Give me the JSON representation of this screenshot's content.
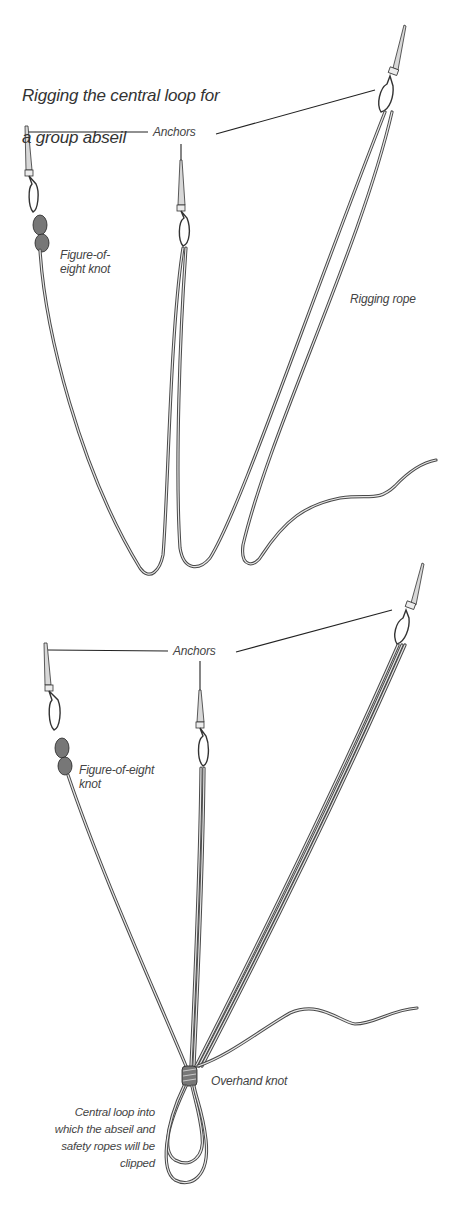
{
  "title": "Rigging the central loop for a group abseil",
  "title_lines": [
    "Rigging the central loop for",
    "a group abseil"
  ],
  "panel_top": {
    "labels": {
      "anchors": "Anchors",
      "figure_of_eight": "Figure-of-\neight knot",
      "rigging_rope": "Rigging rope"
    },
    "elements": [
      "left-anchor",
      "center-anchor",
      "right-anchor",
      "rigging-rope"
    ]
  },
  "panel_bottom": {
    "labels": {
      "anchors": "Anchors",
      "figure_of_eight": "Figure-of-eight\nknot",
      "overhand_knot": "Overhand knot",
      "central_loop": "Central loop into\nwhich the abseil and\nsafety ropes will be\nclipped"
    },
    "elements": [
      "left-anchor",
      "center-anchor",
      "right-anchor",
      "overhand-knot",
      "central-loop",
      "rigging-rope-tail"
    ]
  },
  "colors": {
    "background": "#ffffff",
    "rope_outline": "#4a4a4a",
    "text": "#444444"
  }
}
